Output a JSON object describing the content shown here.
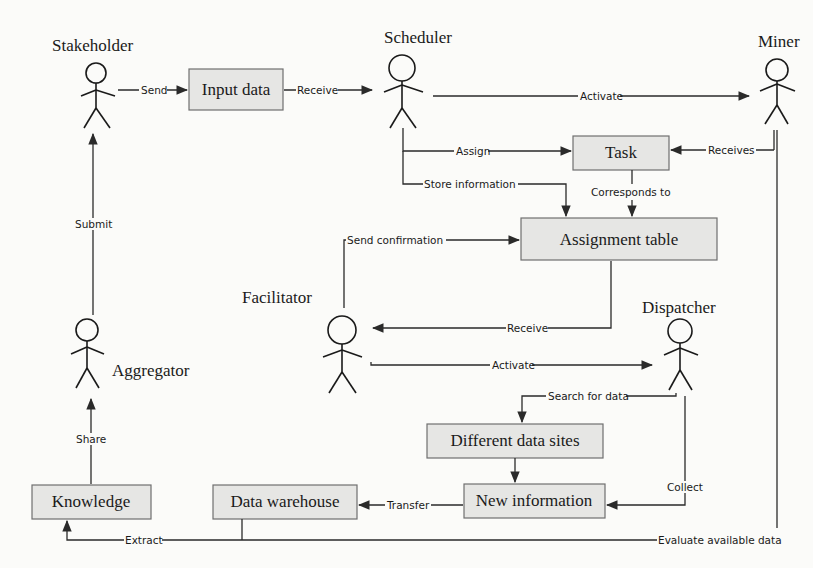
{
  "diagram": {
    "actors": {
      "stakeholder": "Stakeholder",
      "scheduler": "Scheduler",
      "miner": "Miner",
      "facilitator": "Facilitator",
      "dispatcher": "Dispatcher",
      "aggregator": "Aggregator"
    },
    "boxes": {
      "input_data": "Input data",
      "task": "Task",
      "assignment_table": "Assignment table",
      "different_data_sites": "Different data sites",
      "new_information": "New information",
      "data_warehouse": "Data warehouse",
      "knowledge": "Knowledge"
    },
    "edges": {
      "send": "Send",
      "receive_input": "Receive",
      "activate_miner": "Activate",
      "assign": "Assign",
      "store_information": "Store information",
      "receives": "Receives",
      "corresponds_to": "Corresponds to",
      "send_confirmation": "Send confirmation",
      "receive_facilitator": "Receive",
      "activate_dispatcher": "Activate",
      "search_for_data": "Search for data",
      "collect": "Collect",
      "transfer": "Transfer",
      "extract": "Extract",
      "evaluate_available_data": "Evaluate available data",
      "share": "Share",
      "submit": "Submit"
    },
    "colors": {
      "box_fill": "#e6e6e4",
      "box_stroke": "#6f6f6f",
      "line": "#2a2a2a",
      "background": "#fbfbf9"
    }
  }
}
